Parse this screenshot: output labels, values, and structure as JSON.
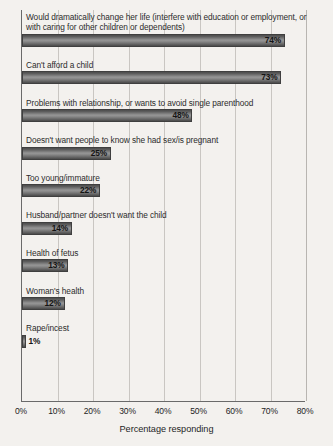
{
  "chart_data": {
    "type": "bar",
    "orientation": "horizontal",
    "title": "",
    "xlabel": "Percentage responding",
    "ylabel": "",
    "xlim": [
      0,
      80
    ],
    "xtick_labels": [
      "0%",
      "10%",
      "20%",
      "30%",
      "40%",
      "50%",
      "60%",
      "70%",
      "80%"
    ],
    "xticks": [
      0,
      10,
      20,
      30,
      40,
      50,
      60,
      70,
      80
    ],
    "grid": "vertical",
    "legend": "none",
    "bar_color": "#6d6d6d",
    "categories": [
      "Would dramatically change her life (interfere with education or employment, or with caring for other children or dependents)",
      "Can't afford a child",
      "Problems with relationship, or wants to avoid single parenthood",
      "Doesn't want people to know she had sex/is pregnant",
      "Too young/immature",
      "Husband/partner doesn't want the child",
      "Health of fetus",
      "Woman's health",
      "Rape/incest"
    ],
    "values": [
      74,
      73,
      48,
      25,
      22,
      14,
      13,
      12,
      1
    ],
    "value_labels": [
      "74%",
      "73%",
      "48%",
      "25%",
      "22%",
      "14%",
      "13%",
      "12%",
      "1%"
    ]
  }
}
